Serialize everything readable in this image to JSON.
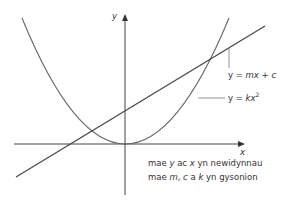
{
  "diagram": {
    "axes": {
      "x_label": "x",
      "y_label": "y"
    },
    "curves": [
      {
        "name": "line",
        "label_prefix": "y = ",
        "label_m": "m",
        "label_x": "x",
        "label_rest": " + ",
        "label_c": "c"
      },
      {
        "name": "parabola",
        "label_prefix": "y = ",
        "label_k": "k",
        "label_x": "x",
        "label_exp": "2"
      }
    ],
    "caption": {
      "line1": {
        "a": "mae ",
        "y": "y",
        "b": " ac ",
        "x": "x",
        "c": " yn newidynnau"
      },
      "line2": {
        "a": "mae ",
        "m": "m",
        "b": ", ",
        "c_var": "c",
        "c": " a ",
        "k": "k",
        "d": " yn gysonion"
      }
    },
    "colors": {
      "stroke": "#555555",
      "text": "#333333"
    }
  }
}
